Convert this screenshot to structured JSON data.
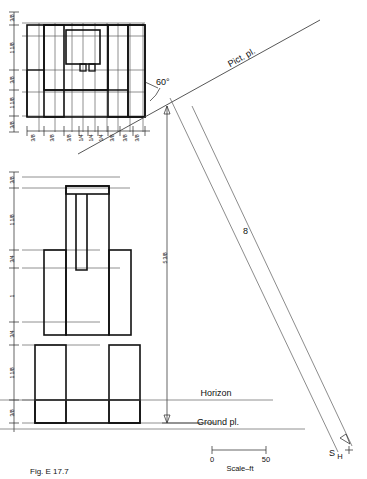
{
  "figure": {
    "caption": "Fig. E 17.7"
  },
  "labels": {
    "pict_plane": "Pict. pl.",
    "angle": "60°",
    "horizon": "Horizon",
    "ground_plane": "Ground pl.",
    "station_point": "S",
    "station_point_sub": "H",
    "height_dim": "5 3/8",
    "ray_label": "8"
  },
  "scale_bar": {
    "start": "0",
    "end": "50",
    "caption": "Scale–ft"
  },
  "plan_view": {
    "name": "top-view-plan",
    "vertical_dims": [
      "3/8",
      "1 1/8",
      "3/8",
      "1 1/8",
      "1 1/8",
      "3/8"
    ],
    "horizontal_dims": [
      "3/8",
      "3/8",
      "3/8",
      "1/4",
      "1/4",
      "1/4",
      "3/8",
      "3/8",
      "3/8"
    ]
  },
  "front_view": {
    "name": "front-elevation",
    "vertical_dims": [
      "3/8",
      "1 1/8",
      "3/4",
      "1",
      "3/4",
      "1 1/8",
      "3/8"
    ]
  }
}
